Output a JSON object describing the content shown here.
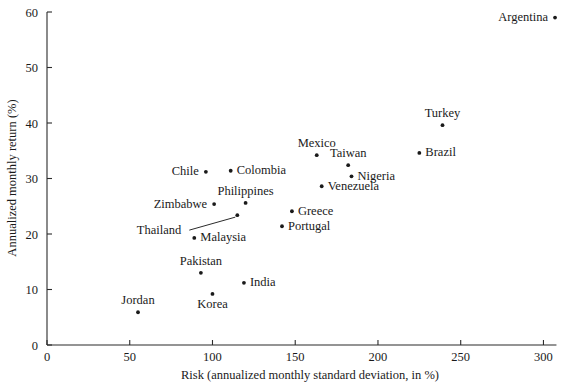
{
  "chart_data": {
    "type": "scatter",
    "title": "",
    "xlabel": "Risk (annualized monthly standard deviation, in %)",
    "ylabel": "Annualized monthly return (%)",
    "xlim": [
      0,
      310
    ],
    "ylim": [
      0,
      60
    ],
    "xticks": [
      0,
      50,
      100,
      150,
      200,
      250,
      300
    ],
    "yticks": [
      0,
      10,
      20,
      30,
      40,
      50,
      60
    ],
    "xticklabels": [
      "0",
      "50",
      "100",
      "150",
      "200",
      "250",
      "300"
    ],
    "yticklabels": [
      "0",
      "10",
      "20",
      "30",
      "40",
      "50",
      "60"
    ],
    "grid": false,
    "legend": "none",
    "points": [
      {
        "name": "Argentina",
        "x": 307,
        "y": 59.0,
        "label_pos": "left"
      },
      {
        "name": "Turkey",
        "x": 239,
        "y": 39.6,
        "label_pos": "above"
      },
      {
        "name": "Brazil",
        "x": 225,
        "y": 34.6,
        "label_pos": "right"
      },
      {
        "name": "Mexico",
        "x": 163,
        "y": 34.2,
        "label_pos": "above"
      },
      {
        "name": "Taiwan",
        "x": 182,
        "y": 32.4,
        "label_pos": "above"
      },
      {
        "name": "Chile",
        "x": 96,
        "y": 31.2,
        "label_pos": "left"
      },
      {
        "name": "Colombia",
        "x": 111,
        "y": 31.4,
        "label_pos": "right"
      },
      {
        "name": "Nigeria",
        "x": 184,
        "y": 30.4,
        "label_pos": "right"
      },
      {
        "name": "Venezuela",
        "x": 166,
        "y": 28.6,
        "label_pos": "right"
      },
      {
        "name": "Philippines",
        "x": 120,
        "y": 25.6,
        "label_pos": "above"
      },
      {
        "name": "Zimbabwe",
        "x": 101,
        "y": 25.4,
        "label_pos": "left"
      },
      {
        "name": "Greece",
        "x": 148,
        "y": 24.1,
        "label_pos": "right"
      },
      {
        "name": "Thailand",
        "x": 115,
        "y": 23.4,
        "label_pos": "leader"
      },
      {
        "name": "Portugal",
        "x": 142,
        "y": 21.4,
        "label_pos": "right"
      },
      {
        "name": "Malaysia",
        "x": 89,
        "y": 19.3,
        "label_pos": "right"
      },
      {
        "name": "Pakistan",
        "x": 93,
        "y": 13.0,
        "label_pos": "above"
      },
      {
        "name": "India",
        "x": 119,
        "y": 11.2,
        "label_pos": "right"
      },
      {
        "name": "Korea",
        "x": 100,
        "y": 9.2,
        "label_pos": "below"
      },
      {
        "name": "Jordan",
        "x": 55,
        "y": 5.9,
        "label_pos": "above"
      }
    ]
  },
  "colors": {
    "axis": "#2b2b2b",
    "marker": "#1a1a1a",
    "text": "#1a1a1a",
    "background": "#ffffff"
  }
}
